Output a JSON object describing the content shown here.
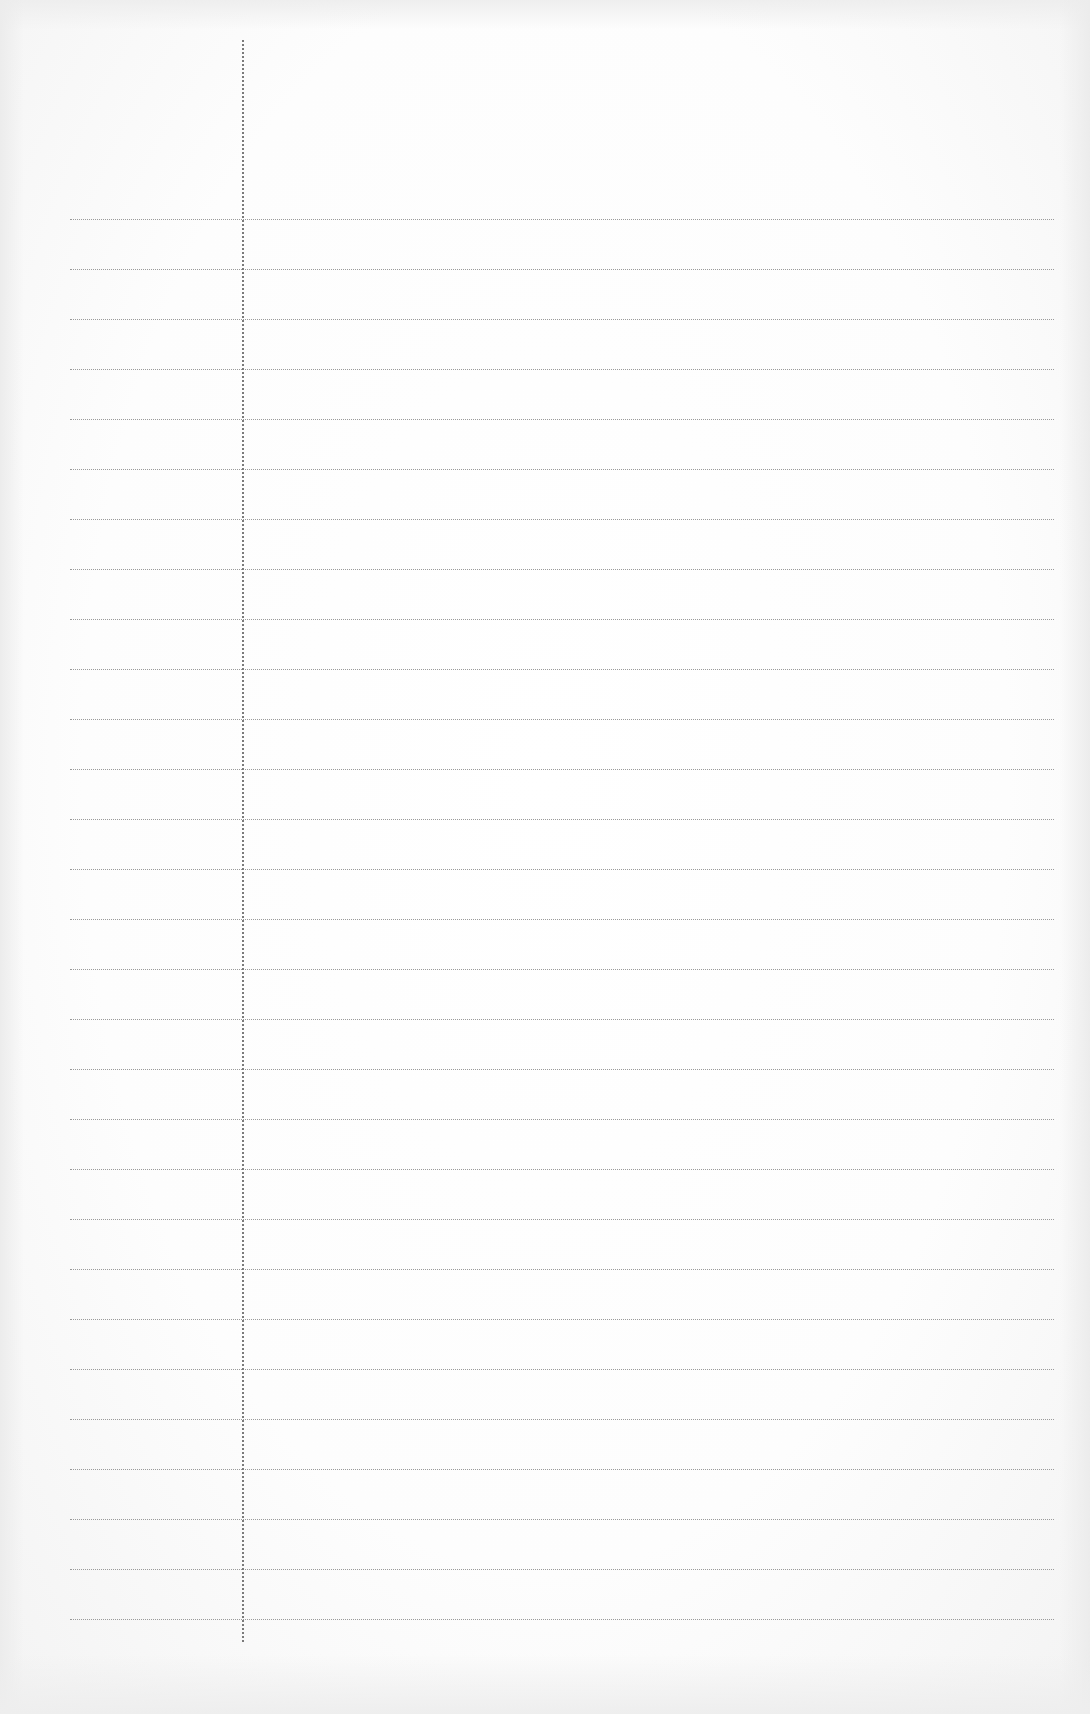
{
  "page": {
    "type": "lined-notepaper",
    "background_color": "#ffffff",
    "line_color": "#9a9a9a",
    "margin_line_color": "#7a7a7a"
  },
  "margin_line": {
    "x": 242,
    "top": 40,
    "bottom": 1642
  },
  "ruled_lines": {
    "count": 29,
    "first_y": 219,
    "spacing": 50,
    "left": 70,
    "right": 1054
  }
}
